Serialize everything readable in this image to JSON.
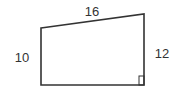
{
  "diagram": {
    "shape": "right-trapezoid",
    "stroke_color": "#333333",
    "background": "#ffffff",
    "vertices": {
      "top_left": [
        41,
        28
      ],
      "top_right": [
        144,
        14
      ],
      "bottom_right": [
        144,
        85
      ],
      "bottom_left": [
        41,
        85
      ]
    },
    "labels": {
      "top": "16",
      "left": "10",
      "right": "12"
    },
    "right_angle_marker": "bottom-right"
  }
}
